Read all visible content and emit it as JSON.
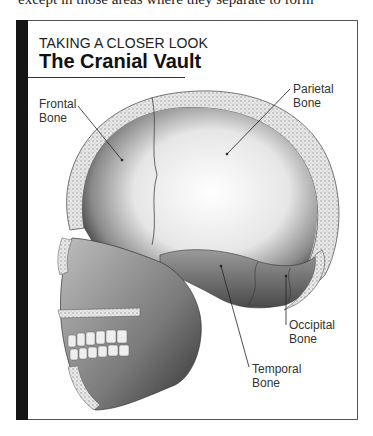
{
  "page": {
    "cut_off_text": "except in those areas where they separate to form"
  },
  "figure": {
    "kicker": "TAKING A CLOSER LOOK",
    "title": "The Cranial Vault",
    "labels": {
      "frontal": {
        "line1": "Frontal",
        "line2": "Bone"
      },
      "parietal": {
        "line1": "Parietal",
        "line2": "Bone"
      },
      "occipital": {
        "line1": "Occipital",
        "line2": "Bone"
      },
      "temporal": {
        "line1": "Temporal",
        "line2": "Bone"
      }
    },
    "colors": {
      "sidebar": "#151515",
      "border": "#555555",
      "text": "#333333"
    }
  }
}
